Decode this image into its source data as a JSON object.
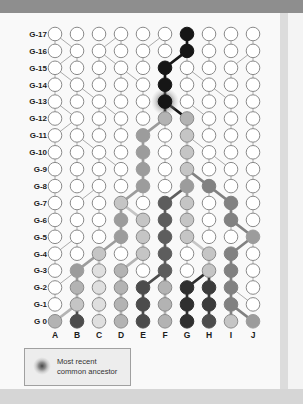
{
  "frame": {
    "top_bar_color": "#8e8e8e",
    "page_bg": "#f9f9f9",
    "right_shadow": "#dcdcdc",
    "right_margin": "#f4f4f4",
    "bottom_strip": "#d6d6d6"
  },
  "legend": {
    "line1": "Most recent",
    "line2": "common ancestor",
    "box_fill": "#ededed",
    "box_stroke": "#a0a0a0",
    "text_color": "#333333"
  },
  "diagram": {
    "row_labels": [
      "G-17",
      "G-16",
      "G-15",
      "G-14",
      "G-13",
      "G-12",
      "G-11",
      "G-10",
      "G-9",
      "G-8",
      "G-7",
      "G-6",
      "G-5",
      "G-4",
      "G-3",
      "G-2",
      "G-1",
      "G 0"
    ],
    "col_labels": [
      "A",
      "B",
      "C",
      "D",
      "E",
      "F",
      "G",
      "H",
      "I",
      "J"
    ],
    "label_color": "#1c1c1c",
    "thin_edge_color": "#ababab",
    "white_stroke": "#8a8a8a",
    "palette": {
      "white": "#ffffff",
      "black": "#161616",
      "veryLight": "#dfdfdf",
      "lightGray": "#c5c5c5",
      "lightMed": "#b3b3b3",
      "medGray": "#9c9c9c",
      "medDark": "#818181",
      "darkMed": "#5d5d5d",
      "dark": "#4c4c4c",
      "darker": "#3b3b3b",
      "veryDark": "#2f2f2f"
    },
    "circles": {
      "G-17": {
        "G": "black"
      },
      "G-16": {
        "G": "black"
      },
      "G-15": {
        "F": "black"
      },
      "G-14": {
        "F": "black"
      },
      "G-13": {
        "F": "black"
      },
      "G-12": {
        "F": "lightMed",
        "G": "lightMed"
      },
      "G-11": {
        "E": "medGray",
        "G": "lightGray"
      },
      "G-10": {
        "E": "medGray",
        "G": "lightGray"
      },
      "G-9": {
        "E": "medGray",
        "G": "lightGray"
      },
      "G-8": {
        "E": "medGray",
        "G": "medGray",
        "H": "medDark"
      },
      "G-7": {
        "D": "lightGray",
        "F": "darkMed",
        "G": "lightGray",
        "I": "medDark"
      },
      "G-6": {
        "D": "medGray",
        "E": "lightGray",
        "F": "darkMed",
        "G": "lightGray",
        "I": "medDark"
      },
      "G-5": {
        "D": "medGray",
        "E": "lightGray",
        "F": "darkMed",
        "G": "lightGray",
        "J": "medGray"
      },
      "G-4": {
        "C": "lightGray",
        "E": "lightGray",
        "F": "darkMed",
        "H": "lightGray",
        "I": "medDark"
      },
      "G-3": {
        "B": "medGray",
        "C": "veryLight",
        "D": "lightMed",
        "F": "darkMed",
        "H": "lightGray",
        "I": "medDark"
      },
      "G-2": {
        "B": "lightMed",
        "C": "veryLight",
        "D": "lightMed",
        "E": "dark",
        "F": "lightMed",
        "G": "veryDark",
        "H": "darker",
        "I": "medDark"
      },
      "G-1": {
        "B": "lightGray",
        "C": "veryLight",
        "D": "lightMed",
        "E": "dark",
        "F": "lightMed",
        "G": "veryDark",
        "H": "darker",
        "I": "medDark"
      },
      "G-0": {
        "A": "lightMed",
        "B": "dark",
        "C": "veryLight",
        "D": "lightMed",
        "E": "dark",
        "F": "lightMed",
        "G": "veryDark",
        "H": "dark",
        "I": "lightGray",
        "J": "medGray"
      }
    },
    "mrca": {
      "row": "G-13",
      "col": "F"
    },
    "edges": {
      "G-16": "A-A,B-A,C-D,D-D,E-F,F-F,G-G*,H-H,I-I,J-J",
      "G-15": "A-B,B-B,C-C,D-C,E-E,F-G*,G-G,H-H,I-J,J-J",
      "G-14": "A-A,B-A,C-C,D-D,E-D,F-F*,G-G,H-G,I-I,J-J",
      "G-13": "A-A,B-B,C-B,D-D,E-E,F-F*,G-G,H-H,I-H,J-J",
      "G-12": "A-A,B-A,C-C,D-C,E-E,F-F*,G-F*,H-G,I-I,J-J",
      "G-11": "A-B,B-B,C-C,D-D,E-F*,F-F,G-G*,H-H,I-I,J-J",
      "G-10": "A-A,B-B,C-B,D-D,E-E*,F-F,G-G*,H-G,I-I,J-J",
      "G-9": "A-A,B-B,C-C,D-C,E-E*,F-F,G-G*,H-H,I-H,J-J",
      "G-8": "A-A,B-B,C-C,D-D,E-E*,F-F,G-G*,H-G*,I-I,J-J",
      "G-7": "A-A,B-C,C-C,D-E*,E-E,F-G*,G-G*,H-H,I-H*,J-J",
      "G-6": "A-A,B-B,C-C,D-D*,E-D*,F-F*,G-G*,H-H,I-I*,J-J",
      "G-5": "A-A,B-B,C-C,D-D*,E-E*,F-F*,G-G*,H-H,I-I,J-I*",
      "G-4": "A-B,B-B,C-D*,D-D,E-E*,F-F*,G-G,H-G*,I-J*,J-J",
      "G-3": "A-A,B-C*,C-C*,D-E*,E-E,F-F*,G-G,H-H*,I-I*,J-J",
      "G-2": "A-B,B-B*,C-C*,D-D*,E-F*,F-F*,G-H*,H-H*,I-I*,J-J",
      "G-1": "A-A,B-B*,C-C*,D-D*,E-E*,F-F*,G-G*,H-H*,I-I*,J-I",
      "G-0": "A-B*,B-B*,C-C*,D-D*,E-E*,F-F*,G-G*,H-H*,I-I*,J-I*"
    },
    "layout": {
      "col_x_start": 55,
      "col_spacing": 22,
      "row_y_start": 34,
      "row_spacing": 16.9,
      "circle_radius": 6.8,
      "label_right_x": 47,
      "col_label_y": 338
    }
  }
}
